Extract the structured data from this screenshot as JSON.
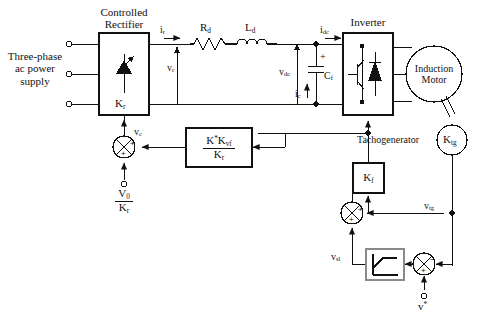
{
  "diagram": {
    "type": "block-diagram"
  },
  "blocks": {
    "rectifier": {
      "title_line1": "Controlled",
      "title_line2": "Rectifier",
      "gain": "K",
      "gain_sub": "r",
      "symbol": "thyristor-icon"
    },
    "inverter": {
      "title": "Inverter",
      "symbol": "transistor-diode-icon"
    },
    "motor": {
      "line1": "Induction",
      "line2": "Motor"
    },
    "tacho": {
      "label": "Tachogenerator",
      "gain": "K",
      "gain_sub": "tg"
    },
    "filter_gain": {
      "gain": "K",
      "gain_sub": "f"
    },
    "controller": {
      "num_k": "K",
      "num_star": "*",
      "num_k2": "K",
      "num_sub": "vf",
      "den_k": "K",
      "den_sub": "r"
    },
    "limiter": {
      "name": "limiter-block",
      "symbol": "saturation-icon"
    }
  },
  "sources": {
    "supply_line1": "Three-phase",
    "supply_line2": "ac power",
    "supply_line3": "supply",
    "bias_num": "V",
    "bias_num_sub": "0",
    "bias_den": "K",
    "bias_den_sub": "r",
    "speed_ref": "v",
    "speed_ref_sup": "*"
  },
  "signals": {
    "i_r": {
      "base": "i",
      "sub": "r"
    },
    "v_r": {
      "base": "v",
      "sub": "r"
    },
    "R_d": {
      "base": "R",
      "sub": "d"
    },
    "L_d": {
      "base": "L",
      "sub": "d"
    },
    "v_dc": {
      "base": "v",
      "sub": "dc"
    },
    "i_dc": {
      "base": "i",
      "sub": "dc"
    },
    "i_c": {
      "base": "i",
      "sub": "c"
    },
    "C_f": {
      "base": "C",
      "sub": "f"
    },
    "v_c": {
      "base": "v",
      "sub": "c"
    },
    "v_tg": {
      "base": "v",
      "sub": "tg"
    },
    "v_sl": {
      "base": "v",
      "sub": "sl"
    },
    "cap_plus": "+"
  },
  "summers": {
    "control": {
      "name": "control-summer",
      "sign_right": "+",
      "sign_bottom": "+"
    },
    "feedback": {
      "name": "feedback-summer",
      "sign_right": "+",
      "sign_bottom": "+"
    },
    "speed_error": {
      "name": "speed-error-summer",
      "sign_right": "−",
      "sign_bottom": "+"
    }
  },
  "colors": {
    "line": "#111111",
    "background": "#ffffff",
    "limiter_border": "#8a8a8a"
  }
}
